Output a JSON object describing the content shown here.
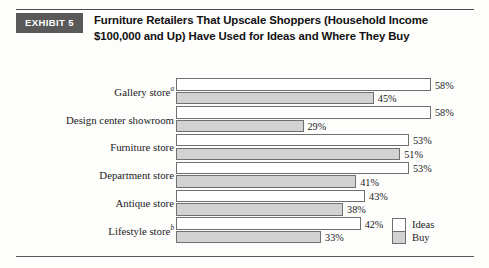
{
  "exhibit": {
    "badge_label": "EXHIBIT 5",
    "title_line_1": "Furniture Retailers That Upscale Shoppers (Household Income",
    "title_line_2": "$100,000 and Up) Have Used for Ideas and Where They Buy"
  },
  "legend": {
    "ideas_label": "Ideas",
    "buy_label": "Buy"
  },
  "colors": {
    "badge_background": "#595959",
    "badge_text": "#ffffff",
    "ideas_bar": "#ffffff",
    "buy_bar": "#d2d2d2",
    "bar_border": "#6f6f6f",
    "rule": "#4a4a4a"
  },
  "chart_data": {
    "type": "bar",
    "orientation": "horizontal",
    "title": "Furniture Retailers That Upscale Shoppers (Household Income $100,000 and Up) Have Used for Ideas and Where They Buy",
    "xlabel": "",
    "ylabel": "",
    "xlim": [
      0,
      58
    ],
    "grid": false,
    "legend_position": "bottom-right",
    "value_suffix": "%",
    "categories": [
      "Gallery store",
      "Design center showroom",
      "Furniture store",
      "Department store",
      "Antique store",
      "Lifestyle store"
    ],
    "category_footnotes": [
      "a",
      "",
      "",
      "",
      "",
      "b"
    ],
    "series": [
      {
        "name": "Ideas",
        "values": [
          58,
          58,
          53,
          53,
          43,
          42
        ],
        "labels": [
          "58%",
          "58%",
          "53%",
          "53%",
          "43%",
          "42%"
        ]
      },
      {
        "name": "Buy",
        "values": [
          45,
          29,
          51,
          41,
          38,
          33
        ],
        "labels": [
          "45%",
          "29%",
          "51%",
          "41%",
          "38%",
          "33%"
        ]
      }
    ]
  }
}
